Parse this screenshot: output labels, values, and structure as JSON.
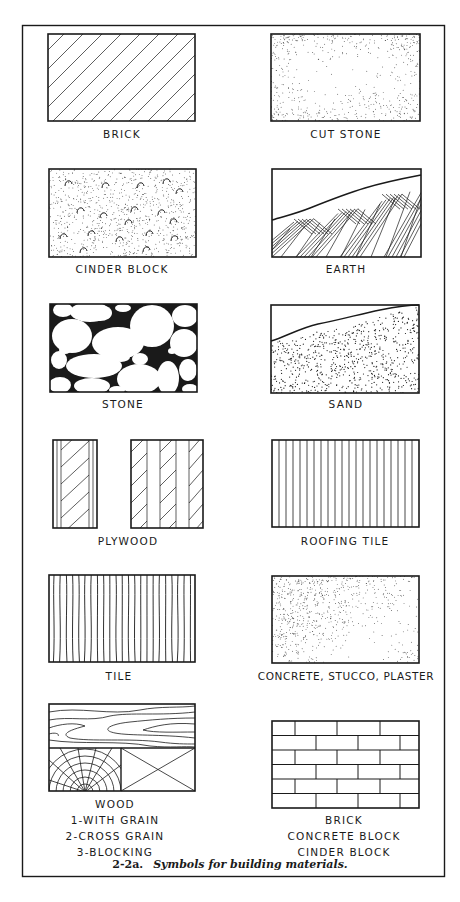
{
  "figure": {
    "number": "2-2a.",
    "caption": "Symbols for building materials.",
    "colors": {
      "ink": "#1a1a1a",
      "paper": "#ffffff"
    }
  },
  "symbols": [
    {
      "id": "brick",
      "label": "BRICK",
      "pattern": "diagonal-hatch"
    },
    {
      "id": "cut-stone",
      "label": "CUT STONE",
      "pattern": "stipple-edge"
    },
    {
      "id": "cinder-block",
      "label": "CINDER BLOCK",
      "pattern": "stipple-with-hooks"
    },
    {
      "id": "earth",
      "label": "EARTH",
      "pattern": "crosshatch-below-ground-line"
    },
    {
      "id": "stone",
      "label": "STONE",
      "pattern": "rubble-cobbles"
    },
    {
      "id": "sand",
      "label": "SAND",
      "pattern": "stipple-below-ground-line"
    },
    {
      "id": "plywood",
      "label": "PLYWOOD",
      "pattern": "layered-diagonal-strips"
    },
    {
      "id": "roofing-tile",
      "label": "ROOFING TILE",
      "pattern": "vertical-lines"
    },
    {
      "id": "tile",
      "label": "TILE",
      "pattern": "wavy-vertical-lines"
    },
    {
      "id": "concrete",
      "label": "CONCRETE, STUCCO, PLASTER",
      "pattern": "fine-stipple"
    },
    {
      "id": "wood",
      "label_lines": [
        "WOOD",
        "1-WITH GRAIN",
        "2-CROSS GRAIN",
        "3-BLOCKING"
      ],
      "pattern": "wood-grain-rings-x"
    },
    {
      "id": "masonry",
      "label_lines": [
        "BRICK",
        "CONCRETE BLOCK",
        "CINDER BLOCK"
      ],
      "pattern": "running-bond"
    }
  ]
}
